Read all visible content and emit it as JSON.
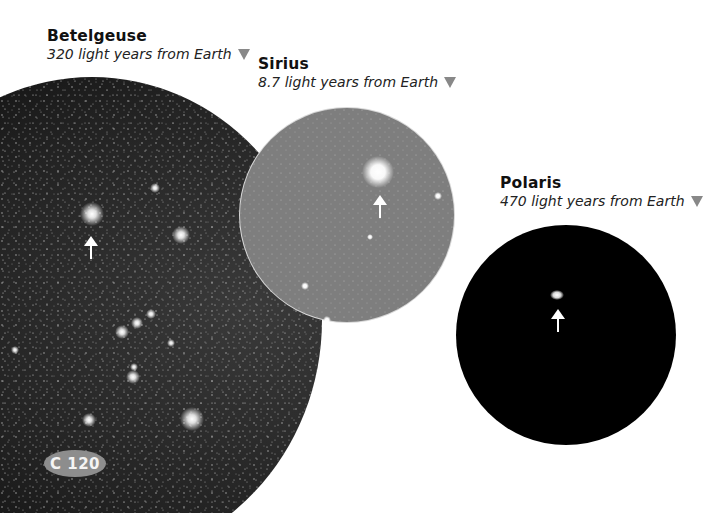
{
  "stars": [
    {
      "name": "Betelgeuse",
      "distance": "320 light years from Earth",
      "marker_icon": "triangle-down-icon"
    },
    {
      "name": "Sirius",
      "distance": "8.7 light years from Earth",
      "marker_icon": "triangle-down-icon"
    },
    {
      "name": "Polaris",
      "distance": "470 light years from Earth",
      "marker_icon": "triangle-down-icon"
    }
  ],
  "badge": {
    "label": "C 120"
  },
  "colors": {
    "triangle": "#888888",
    "betelgeuse_field": "#151515",
    "sirius_field": "#7d7d7d",
    "polaris_field": "#000000",
    "badge": "#8d8d8d"
  }
}
